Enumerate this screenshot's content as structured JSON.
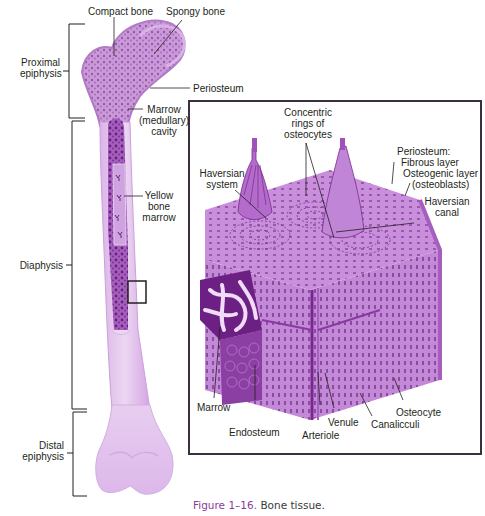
{
  "figure": {
    "number_label": "Figure 1–16.",
    "title": "Bone tissue."
  },
  "long_bone": {
    "top_labels": {
      "compact_bone": "Compact bone",
      "spongy_bone": "Spongy bone"
    },
    "regions": {
      "proximal_epiphysis": [
        "Proximal",
        "epiphysis"
      ],
      "diaphysis": "Diaphysis",
      "distal_epiphysis": [
        "Distal",
        "epiphysis"
      ]
    },
    "right_labels": {
      "periosteum": "Periosteum",
      "marrow_cavity": [
        "Marrow",
        "(medullary)",
        "cavity"
      ],
      "yellow_bone_marrow": [
        "Yellow",
        "bone",
        "marrow"
      ]
    }
  },
  "inset": {
    "labels": {
      "concentric_rings": [
        "Concentric",
        "rings of",
        "osteocytes"
      ],
      "haversian_system": [
        "Haversian",
        "system"
      ],
      "periosteum_header": "Periosteum:",
      "fibrous_layer": "Fibrous layer",
      "osteogenic_layer": "Osteogenic layer",
      "osteoblasts": "(osteoblasts)",
      "haversian_canal": [
        "Haversian",
        "canal"
      ],
      "marrow": "Marrow",
      "endosteum": "Endosteum",
      "arteriole": "Arteriole",
      "venule": "Venule",
      "canaliculi": "Canalicculi",
      "osteocyte": "Osteocyte"
    }
  },
  "colors": {
    "bone_light": "#e6c8ee",
    "bone_mid": "#c792d6",
    "bone_dark": "#7a2a8e",
    "marrow_dark": "#5e1470",
    "line": "#231f20",
    "caption_accent": "#8a3b9a"
  }
}
